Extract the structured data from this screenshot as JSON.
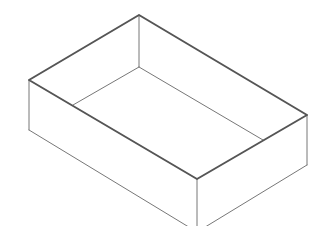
{
  "diagram": {
    "colors": {
      "background": "#ffffff",
      "rim": "#555555",
      "edge": "#777777"
    },
    "vertices": {
      "top_back": [
        139,
        15
      ],
      "top_left": [
        29,
        80
      ],
      "top_right": [
        307,
        115
      ],
      "top_front": [
        197,
        179
      ],
      "bottom_left": [
        29,
        130
      ],
      "bottom_right": [
        307,
        165
      ],
      "bottom_front": [
        197,
        232
      ],
      "inner_back": [
        139,
        67
      ],
      "inner_left": [
        73,
        105
      ],
      "inner_right": [
        263,
        140
      ]
    }
  }
}
